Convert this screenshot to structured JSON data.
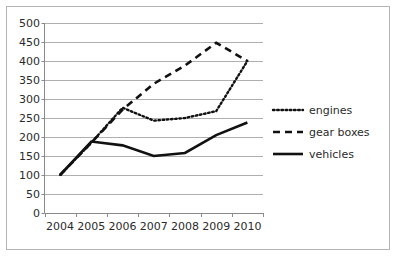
{
  "chart_data": {
    "type": "line",
    "title": "",
    "subtitle": "",
    "xlabel": "",
    "ylabel": "",
    "categories": [
      "2004",
      "2005",
      "2006",
      "2007",
      "2008",
      "2009",
      "2010"
    ],
    "x": [
      2004,
      2005,
      2006,
      2007,
      2008,
      2009,
      2010
    ],
    "ylim": [
      0,
      500
    ],
    "yticks": [
      0,
      50,
      100,
      150,
      200,
      250,
      300,
      350,
      400,
      450,
      500
    ],
    "ytick_labels": [
      "0",
      "50",
      "100",
      "150",
      "200",
      "250",
      "300",
      "350",
      "400",
      "450",
      "500"
    ],
    "grid": true,
    "legend_position": "right",
    "series": [
      {
        "name": "engines",
        "style": "dotted",
        "color": "#111111",
        "values": [
          100,
          185,
          277,
          243,
          250,
          268,
          400
        ]
      },
      {
        "name": "gear boxes",
        "style": "dashed",
        "color": "#111111",
        "values": [
          100,
          185,
          272,
          340,
          388,
          448,
          400
        ]
      },
      {
        "name": "vehicles",
        "style": "solid",
        "color": "#111111",
        "values": [
          100,
          188,
          178,
          150,
          158,
          205,
          238
        ]
      }
    ]
  },
  "legend": {
    "items": [
      {
        "label": "engines",
        "style": "dotted"
      },
      {
        "label": "gear boxes",
        "style": "dashed"
      },
      {
        "label": "vehicles",
        "style": "solid"
      }
    ]
  },
  "colors": {
    "ink": "#111111",
    "grid": "#9a9a9a",
    "axis": "#8a8a8a",
    "frame": "#b4b4b4",
    "background": "#ffffff"
  }
}
